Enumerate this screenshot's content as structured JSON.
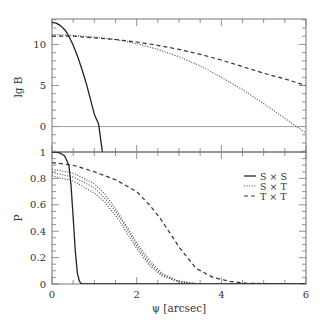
{
  "chart_data": [
    {
      "type": "line",
      "panel": "top",
      "title": "",
      "xlabel": "",
      "ylabel": "lg B",
      "xlim": [
        0,
        6
      ],
      "ylim": [
        -3.1,
        13.1
      ],
      "yticks": [
        0,
        5,
        10
      ],
      "ytick_labels": [
        "0",
        "5",
        "10"
      ],
      "xticks": [
        0,
        1,
        2,
        3,
        4,
        5,
        6
      ],
      "grid": false,
      "reference_line": {
        "y": 0,
        "style": "solid-gray"
      },
      "series": [
        {
          "name": "S × S",
          "style": "solid",
          "x": [
            0,
            0.1,
            0.2,
            0.3,
            0.4,
            0.5,
            0.6,
            0.7,
            0.8,
            0.9,
            1.0,
            1.1,
            1.19
          ],
          "y": [
            12.7,
            12.6,
            12.3,
            11.8,
            11.0,
            9.9,
            8.6,
            7.1,
            5.4,
            3.5,
            1.5,
            0.3,
            -3.1
          ]
        },
        {
          "name": "S × T",
          "style": "dotted",
          "x": [
            0,
            0.5,
            1,
            1.5,
            2,
            2.5,
            3,
            3.5,
            4,
            4.5,
            5,
            5.5,
            6
          ],
          "y": [
            11.2,
            11.1,
            10.9,
            10.6,
            10.1,
            9.4,
            8.5,
            7.4,
            6.0,
            4.5,
            2.8,
            1.0,
            -0.8
          ]
        },
        {
          "name": "T × T",
          "style": "dashed",
          "x": [
            0,
            0.5,
            1,
            1.5,
            2,
            2.5,
            3,
            3.5,
            4,
            4.5,
            5,
            5.5,
            6
          ],
          "y": [
            11.0,
            11.0,
            10.8,
            10.6,
            10.3,
            9.9,
            9.4,
            8.8,
            8.1,
            7.3,
            6.5,
            5.8,
            5.0
          ]
        }
      ]
    },
    {
      "type": "line",
      "panel": "bottom",
      "title": "",
      "xlabel": "ψ [arcsec]",
      "ylabel": "P",
      "xlim": [
        0,
        6
      ],
      "ylim": [
        0,
        1
      ],
      "xticks": [
        0,
        2,
        4,
        6
      ],
      "xtick_labels": [
        "0",
        "2",
        "4",
        "6"
      ],
      "yticks": [
        0,
        0.2,
        0.4,
        0.6,
        0.8,
        1
      ],
      "ytick_labels": [
        "0",
        "0.2",
        "0.4",
        "0.6",
        "0.8",
        "1"
      ],
      "grid": false,
      "legend": {
        "position": "upper right",
        "entries": [
          "S × S",
          "S × T",
          "T × T"
        ]
      },
      "series": [
        {
          "name": "S × S",
          "style": "solid",
          "x": [
            0,
            0.1,
            0.2,
            0.3,
            0.4,
            0.45,
            0.5,
            0.55,
            0.6,
            0.65,
            0.7,
            0.8,
            6
          ],
          "y": [
            1.0,
            1.0,
            0.99,
            0.97,
            0.9,
            0.75,
            0.5,
            0.25,
            0.08,
            0.02,
            0.0,
            0.0,
            0.0
          ]
        },
        {
          "name": "S × T (a)",
          "style": "dotted",
          "x": [
            0,
            0.5,
            1,
            1.25,
            1.5,
            1.8,
            2,
            2.3,
            2.6,
            3,
            3.5,
            6
          ],
          "y": [
            0.87,
            0.84,
            0.76,
            0.68,
            0.57,
            0.42,
            0.31,
            0.18,
            0.08,
            0.02,
            0.0,
            0.0
          ]
        },
        {
          "name": "S × T (b)",
          "style": "dotted",
          "x": [
            0,
            0.5,
            1,
            1.25,
            1.5,
            1.75,
            2,
            2.3,
            2.6,
            3,
            3.5,
            6
          ],
          "y": [
            0.845,
            0.81,
            0.73,
            0.65,
            0.55,
            0.43,
            0.29,
            0.16,
            0.07,
            0.02,
            0.0,
            0.0
          ]
        },
        {
          "name": "S × T (c)",
          "style": "dotted",
          "x": [
            0,
            0.5,
            1,
            1.25,
            1.5,
            1.65,
            2,
            2.3,
            2.6,
            3,
            3.5,
            6
          ],
          "y": [
            0.82,
            0.78,
            0.69,
            0.62,
            0.52,
            0.45,
            0.27,
            0.14,
            0.06,
            0.015,
            0.0,
            0.0
          ]
        },
        {
          "name": "T × T",
          "style": "dashed",
          "x": [
            0,
            0.5,
            1,
            1.5,
            2,
            2.3,
            2.55,
            2.8,
            3,
            3.4,
            3.8,
            4.2,
            4.6,
            6
          ],
          "y": [
            0.92,
            0.9,
            0.85,
            0.79,
            0.7,
            0.6,
            0.5,
            0.38,
            0.28,
            0.12,
            0.05,
            0.02,
            0.005,
            0.0
          ]
        }
      ]
    }
  ],
  "labels": {
    "top_ylabel": "lg B",
    "bottom_ylabel": "P",
    "xlabel": "ψ [arcsec]",
    "legend": [
      "S × S",
      "S × T",
      "T × T"
    ]
  }
}
